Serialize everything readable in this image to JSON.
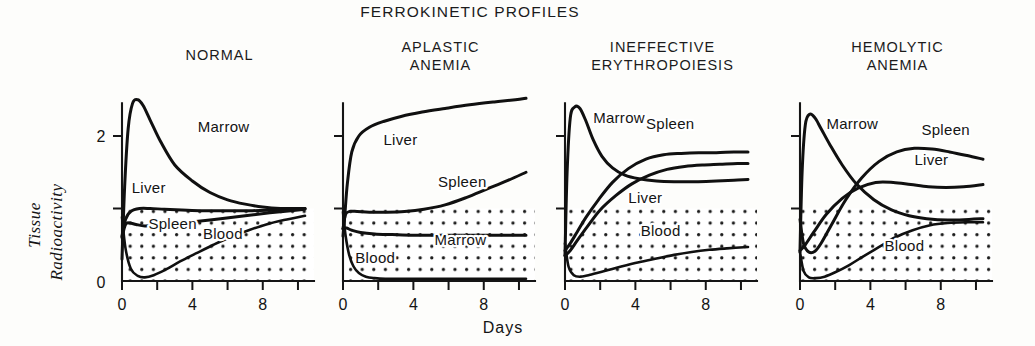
{
  "figure": {
    "title": "FERROKINETIC PROFILES",
    "x_axis_title": "Days",
    "y_axis_title_line1": "Tissue",
    "y_axis_title_line2": "Radioactivity"
  },
  "chart_data": {
    "type": "line",
    "title": "FERROKINETIC PROFILES",
    "xlabel": "Days",
    "ylabel": "Tissue Radioactivity",
    "xlim": [
      0,
      10.4
    ],
    "ylim": [
      0,
      2.45
    ],
    "xticks": [
      0,
      2,
      4,
      6,
      8,
      10
    ],
    "xtick_labels": [
      "0",
      "",
      "4",
      "",
      "8",
      ""
    ],
    "yticks": [
      0,
      1,
      2
    ],
    "ytick_labels": [
      "0",
      "",
      "2"
    ],
    "grid": false,
    "legend": "inline-annotations",
    "shaded_region_note": "Stippled (dotted) fill covers region from y=0 up to y=1.0 in every panel",
    "panels": [
      {
        "name": "NORMAL",
        "title_lines": [
          "NORMAL"
        ],
        "series": [
          {
            "name": "Marrow",
            "label_x": 4.3,
            "label_y": 2.05,
            "x": [
              0,
              0.15,
              0.35,
              0.6,
              0.9,
              1.2,
              1.6,
              2.2,
              3.0,
              4.0,
              5.0,
              6.0,
              7.0,
              8.0,
              9.0,
              10.0,
              10.4
            ],
            "y": [
              0.3,
              1.3,
              2.1,
              2.45,
              2.5,
              2.42,
              2.22,
              1.92,
              1.6,
              1.38,
              1.22,
              1.12,
              1.06,
              1.02,
              1.0,
              1.0,
              1.0
            ]
          },
          {
            "name": "Liver",
            "label_x": 0.55,
            "label_y": 1.22,
            "x": [
              0,
              0.2,
              0.5,
              1.0,
              1.6,
              2.4,
              3.4,
              4.6,
              6.0,
              7.4,
              8.6,
              9.6,
              10.4
            ],
            "y": [
              0.62,
              0.85,
              0.96,
              1.0,
              1.0,
              0.99,
              0.98,
              0.97,
              0.97,
              0.97,
              0.98,
              0.99,
              1.0
            ]
          },
          {
            "name": "Spleen",
            "label_x": 1.5,
            "label_y": 0.72,
            "x": [
              0,
              0.2,
              0.45,
              0.8,
              1.3,
              2.0,
              3.0,
              4.2,
              5.6,
              7.0,
              8.4,
              9.6,
              10.4
            ],
            "y": [
              0.6,
              0.78,
              0.8,
              0.78,
              0.76,
              0.77,
              0.79,
              0.82,
              0.86,
              0.9,
              0.94,
              0.97,
              0.99
            ]
          },
          {
            "name": "Blood",
            "label_x": 4.6,
            "label_y": 0.58,
            "x": [
              0,
              0.2,
              0.5,
              0.9,
              1.3,
              1.8,
              2.5,
              3.3,
              4.2,
              5.2,
              6.2,
              7.2,
              8.2,
              9.2,
              10.4
            ],
            "y": [
              0.88,
              0.45,
              0.17,
              0.07,
              0.05,
              0.08,
              0.16,
              0.27,
              0.38,
              0.5,
              0.61,
              0.7,
              0.78,
              0.84,
              0.9
            ]
          }
        ]
      },
      {
        "name": "APLASTIC ANEMIA",
        "title_lines": [
          "APLASTIC",
          "ANEMIA"
        ],
        "series": [
          {
            "name": "Liver",
            "label_x": 2.3,
            "label_y": 1.88,
            "x": [
              0,
              0.1,
              0.25,
              0.5,
              0.9,
              1.5,
              2.3,
              3.3,
              4.5,
              5.8,
              7.2,
              8.6,
              9.8,
              10.4
            ],
            "y": [
              0.62,
              0.9,
              1.35,
              1.78,
              2.0,
              2.12,
              2.2,
              2.27,
              2.33,
              2.38,
              2.43,
              2.47,
              2.5,
              2.52
            ]
          },
          {
            "name": "Spleen",
            "label_x": 5.4,
            "label_y": 1.3,
            "x": [
              0,
              0.15,
              0.4,
              0.8,
              1.5,
              2.5,
              3.5,
              4.6,
              5.8,
              7.0,
              8.2,
              9.3,
              10.4
            ],
            "y": [
              0.72,
              0.92,
              0.96,
              0.96,
              0.95,
              0.95,
              0.96,
              0.99,
              1.05,
              1.15,
              1.27,
              1.38,
              1.5
            ]
          },
          {
            "name": "Marrow",
            "label_x": 5.2,
            "label_y": 0.5,
            "x": [
              0,
              0.2,
              0.5,
              1.0,
              1.8,
              2.8,
              4.0,
              5.2,
              6.4,
              7.6,
              8.8,
              9.8,
              10.4
            ],
            "y": [
              0.72,
              0.73,
              0.7,
              0.67,
              0.65,
              0.64,
              0.63,
              0.63,
              0.63,
              0.63,
              0.63,
              0.63,
              0.63
            ]
          },
          {
            "name": "Blood",
            "label_x": 0.7,
            "label_y": 0.25,
            "x": [
              0,
              0.15,
              0.35,
              0.6,
              0.9,
              1.3,
              1.8,
              2.4,
              3.2,
              4.2,
              5.4,
              6.8,
              8.2,
              9.6,
              10.4
            ],
            "y": [
              0.95,
              0.62,
              0.36,
              0.2,
              0.11,
              0.06,
              0.04,
              0.03,
              0.03,
              0.03,
              0.03,
              0.03,
              0.03,
              0.03,
              0.03
            ]
          }
        ]
      },
      {
        "name": "INEFFECTIVE ERYTHROPOIESIS",
        "title_lines": [
          "INEFFECTIVE",
          "ERYTHROPOIESIS"
        ],
        "series": [
          {
            "name": "Marrow",
            "label_x": 1.6,
            "label_y": 2.18,
            "x": [
              0,
              0.12,
              0.3,
              0.55,
              0.85,
              1.2,
              1.6,
              2.1,
              2.7,
              3.4,
              4.2,
              5.2,
              6.2,
              7.4,
              8.6,
              9.6,
              10.4
            ],
            "y": [
              0.35,
              1.5,
              2.25,
              2.4,
              2.38,
              2.2,
              1.95,
              1.72,
              1.56,
              1.46,
              1.41,
              1.38,
              1.37,
              1.37,
              1.38,
              1.39,
              1.4
            ]
          },
          {
            "name": "Spleen",
            "label_x": 4.6,
            "label_y": 2.1,
            "x": [
              0,
              0.3,
              0.7,
              1.2,
              1.9,
              2.7,
              3.6,
              4.6,
              5.6,
              6.6,
              7.6,
              8.6,
              9.6,
              10.4
            ],
            "y": [
              0.42,
              0.52,
              0.68,
              0.88,
              1.12,
              1.36,
              1.55,
              1.68,
              1.74,
              1.76,
              1.77,
              1.77,
              1.78,
              1.78
            ]
          },
          {
            "name": "Liver",
            "label_x": 3.6,
            "label_y": 1.08,
            "x": [
              0,
              0.3,
              0.7,
              1.3,
              2.0,
              2.9,
              3.8,
              4.8,
              5.8,
              6.8,
              7.8,
              8.8,
              9.8,
              10.4
            ],
            "y": [
              0.35,
              0.42,
              0.56,
              0.76,
              0.98,
              1.18,
              1.34,
              1.46,
              1.54,
              1.58,
              1.6,
              1.61,
              1.62,
              1.62
            ]
          },
          {
            "name": "Blood",
            "label_x": 4.3,
            "label_y": 0.62,
            "x": [
              0,
              0.2,
              0.5,
              0.9,
              1.5,
              2.3,
              3.2,
              4.2,
              5.2,
              6.2,
              7.2,
              8.2,
              9.2,
              10.4
            ],
            "y": [
              0.52,
              0.2,
              0.08,
              0.06,
              0.09,
              0.14,
              0.2,
              0.26,
              0.31,
              0.36,
              0.4,
              0.43,
              0.45,
              0.47
            ]
          }
        ]
      },
      {
        "name": "HEMOLYTIC ANEMIA",
        "title_lines": [
          "HEMOLYTIC",
          "ANEMIA"
        ],
        "series": [
          {
            "name": "Marrow",
            "label_x": 1.5,
            "label_y": 2.1,
            "x": [
              0,
              0.12,
              0.3,
              0.55,
              0.85,
              1.2,
              1.7,
              2.4,
              3.2,
              4.2,
              5.2,
              6.2,
              7.2,
              8.4,
              9.6,
              10.4
            ],
            "y": [
              0.4,
              1.5,
              2.15,
              2.3,
              2.25,
              2.1,
              1.88,
              1.6,
              1.34,
              1.12,
              0.98,
              0.9,
              0.86,
              0.84,
              0.85,
              0.86
            ]
          },
          {
            "name": "Spleen",
            "label_x": 6.9,
            "label_y": 2.02,
            "x": [
              0,
              0.2,
              0.5,
              0.85,
              1.2,
              1.8,
              2.6,
              3.5,
              4.5,
              5.5,
              6.5,
              7.5,
              8.5,
              9.5,
              10.4
            ],
            "y": [
              0.85,
              0.52,
              0.4,
              0.41,
              0.52,
              0.78,
              1.12,
              1.42,
              1.65,
              1.78,
              1.83,
              1.82,
              1.78,
              1.73,
              1.68
            ]
          },
          {
            "name": "Liver",
            "label_x": 6.5,
            "label_y": 1.6,
            "x": [
              0,
              0.3,
              0.8,
              1.5,
              2.4,
              3.3,
              4.3,
              5.3,
              6.3,
              7.3,
              8.3,
              9.3,
              10.4
            ],
            "y": [
              0.42,
              0.5,
              0.68,
              0.92,
              1.14,
              1.28,
              1.36,
              1.36,
              1.33,
              1.3,
              1.29,
              1.3,
              1.33
            ]
          },
          {
            "name": "Blood",
            "label_x": 4.8,
            "label_y": 0.42,
            "x": [
              0,
              0.2,
              0.5,
              0.9,
              1.4,
              2.0,
              2.8,
              3.6,
              4.5,
              5.4,
              6.4,
              7.4,
              8.4,
              9.4,
              10.4
            ],
            "y": [
              0.4,
              0.14,
              0.05,
              0.04,
              0.06,
              0.12,
              0.22,
              0.34,
              0.47,
              0.6,
              0.7,
              0.77,
              0.8,
              0.81,
              0.81
            ]
          }
        ]
      }
    ]
  }
}
